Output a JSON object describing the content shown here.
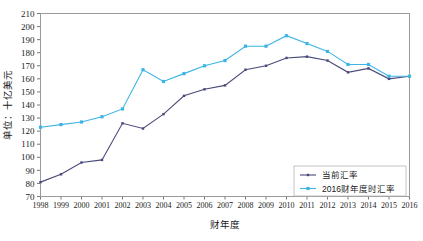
{
  "chart_data": {
    "type": "line",
    "title": "",
    "xlabel": "财年度",
    "ylabel": "单位：十亿美元",
    "x": [
      1998,
      1999,
      2000,
      2001,
      2002,
      2003,
      2004,
      2005,
      2006,
      2007,
      2008,
      2009,
      2010,
      2011,
      2012,
      2013,
      2014,
      2015,
      2016
    ],
    "xtick_labels": [
      "1998",
      "1999",
      "2000",
      "2001",
      "2002",
      "2003",
      "2004",
      "2005",
      "2006",
      "2007",
      "2008",
      "2009",
      "2010",
      "2011",
      "2012",
      "2013",
      "2014",
      "2015",
      "2016"
    ],
    "ytick_labels": [
      "70",
      "80",
      "90",
      "100",
      "110",
      "120",
      "130",
      "140",
      "150",
      "160",
      "170",
      "180",
      "190",
      "200",
      "210"
    ],
    "ylim": [
      70,
      210
    ],
    "ytick_step": 10,
    "grid": false,
    "legend_position": "bottom-right",
    "series": [
      {
        "name": "当前汇率",
        "color": "#4a4a7a",
        "marker": "square",
        "values": [
          81,
          87,
          96,
          98,
          126,
          122,
          133,
          147,
          152,
          155,
          167,
          170,
          176,
          177,
          174,
          165,
          168,
          160,
          162
        ]
      },
      {
        "name": "2016财年度时汇率",
        "color": "#3cb4e5",
        "marker": "square",
        "values": [
          123,
          125,
          127,
          131,
          137,
          167,
          158,
          164,
          170,
          174,
          185,
          185,
          193,
          187,
          181,
          171,
          171,
          162,
          162
        ]
      }
    ]
  },
  "axes": {
    "y_axis_title": "单位：十亿美元",
    "x_axis_title": "财年度"
  },
  "legend": {
    "items": [
      {
        "label": "当前汇率",
        "color": "#4a4a7a"
      },
      {
        "label": "2016财年度时汇率",
        "color": "#3cb4e5"
      }
    ]
  }
}
